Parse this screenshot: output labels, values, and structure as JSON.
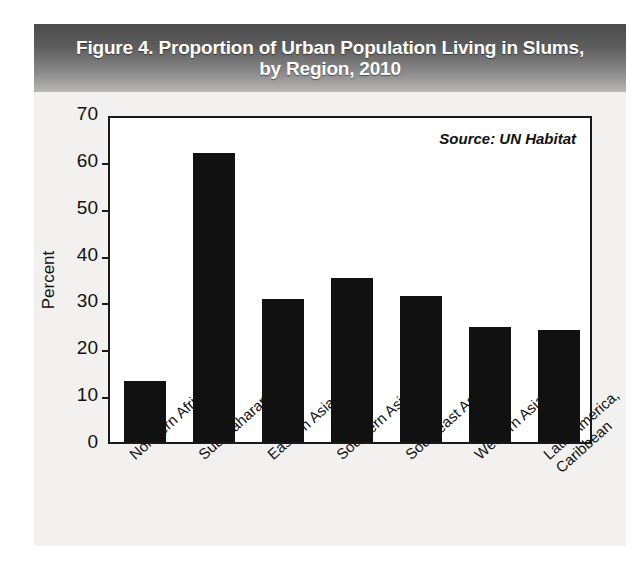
{
  "figure": {
    "title_line1": "Figure 4. Proportion of Urban Population Living in Slums,",
    "title_line2": "by Region, 2010",
    "source_note": "Source: UN Habitat",
    "banner_color": "#5e5e5e",
    "bar_color": "#111111",
    "plot_background": "#ffffff",
    "figure_background": "#f2f1ef"
  },
  "chart_data": {
    "type": "bar",
    "title": "Figure 4. Proportion of Urban Population Living in Slums, by Region, 2010",
    "xlabel": "",
    "ylabel": "Percent",
    "ylim": [
      0,
      70
    ],
    "yticks": [
      0,
      10,
      20,
      30,
      40,
      50,
      60,
      70
    ],
    "ytick_labels": [
      "0",
      "10",
      "20",
      "30",
      "40",
      "50",
      "60",
      "70"
    ],
    "grid": false,
    "legend": false,
    "annotations": [
      "Source: UN Habitat"
    ],
    "categories": [
      "Northern Africa",
      "Sub-Saharan Africa",
      "Eastern Asia",
      "Southern Asia",
      "Southeast Asia",
      "Western Asia",
      "Latin America, Caribbean"
    ],
    "category_lines": [
      [
        "Northern Africa"
      ],
      [
        "Sub-Saharan Africa"
      ],
      [
        "Eastern Asia"
      ],
      [
        "Southern Asia"
      ],
      [
        "Southeast Asia"
      ],
      [
        "Western Asia"
      ],
      [
        "Latin America,",
        "Caribbean"
      ]
    ],
    "values": [
      13.0,
      61.7,
      30.6,
      35.0,
      31.1,
      24.6,
      23.9
    ]
  }
}
